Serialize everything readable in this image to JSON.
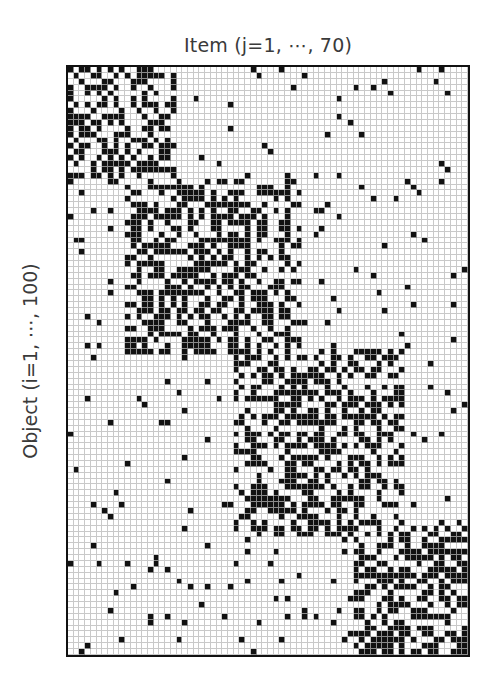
{
  "chart_data": {
    "type": "heatmap",
    "title": "",
    "xlabel": "Item (j=1, ⋯, 70)",
    "ylabel": "Object (i=1, ⋯, 100)",
    "n_cols": 70,
    "n_rows": 100,
    "value_type": "binary",
    "colors": {
      "on": "#111111",
      "off": "#ffffff",
      "grid": "#c9c9c9",
      "border": "#111111"
    },
    "blocks": [
      {
        "name": "cluster-1",
        "rows": [
          0,
          20
        ],
        "cols": [
          0,
          19
        ],
        "density": 0.45
      },
      {
        "name": "cluster-2",
        "rows": [
          19,
          49
        ],
        "cols": [
          10,
          41
        ],
        "density": 0.5
      },
      {
        "name": "cluster-3",
        "rows": [
          48,
          80
        ],
        "cols": [
          29,
          59
        ],
        "density": 0.5
      },
      {
        "name": "cluster-4",
        "rows": [
          78,
          100
        ],
        "cols": [
          50,
          70
        ],
        "density": 0.55
      }
    ],
    "background_density": 0.035,
    "grid": true,
    "legend": null
  }
}
